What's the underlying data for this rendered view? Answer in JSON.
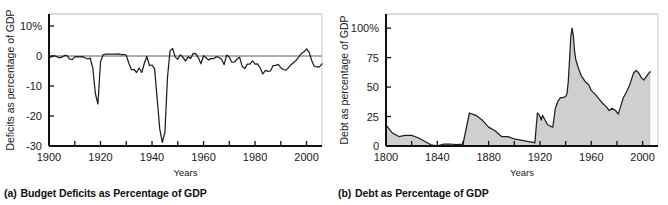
{
  "figure": {
    "background": "#ffffff",
    "line_color": "#1f1f1f",
    "fill_color": "#cfcfcf",
    "frame_color": "#111111"
  },
  "panels": [
    {
      "id": "a",
      "caption_label": "(a)",
      "caption_text": "Budget Deficits as Percentage of GDP",
      "ylabel": "Deficits as percentage of GDP",
      "xlabel": "Years"
    },
    {
      "id": "b",
      "caption_label": "(b)",
      "caption_text": "Debt as Percentage of GDP",
      "ylabel": "Debt as percentage of GDP",
      "xlabel": "Years"
    }
  ],
  "chart_data": [
    {
      "type": "line",
      "title": "Budget Deficits as Percentage of GDP",
      "xlabel": "Years",
      "ylabel": "Deficits as percentage of GDP",
      "xlim": [
        1900,
        2006
      ],
      "ylim": [
        -30,
        14
      ],
      "yticks": [
        10,
        0,
        -10,
        -20,
        -30
      ],
      "ytick_labels": [
        "10%",
        "0",
        "-10",
        "-20",
        "-30"
      ],
      "xticks": [
        1900,
        1910,
        1920,
        1930,
        1940,
        1950,
        1960,
        1970,
        1980,
        1990,
        2000
      ],
      "xtick_labels": [
        "1900",
        "",
        "1920",
        "",
        "1940",
        "",
        "1960",
        "",
        "1980",
        "",
        "2000"
      ],
      "zero_line": 0,
      "grid": false,
      "legend": false,
      "x": [
        1900,
        1901,
        1902,
        1903,
        1904,
        1905,
        1906,
        1907,
        1908,
        1909,
        1910,
        1911,
        1912,
        1913,
        1914,
        1915,
        1916,
        1917,
        1918,
        1919,
        1920,
        1921,
        1922,
        1923,
        1924,
        1925,
        1926,
        1927,
        1928,
        1929,
        1930,
        1931,
        1932,
        1933,
        1934,
        1935,
        1936,
        1937,
        1938,
        1939,
        1940,
        1941,
        1942,
        1943,
        1944,
        1945,
        1946,
        1947,
        1948,
        1949,
        1950,
        1951,
        1952,
        1953,
        1954,
        1955,
        1956,
        1957,
        1958,
        1959,
        1960,
        1961,
        1962,
        1963,
        1964,
        1965,
        1966,
        1967,
        1968,
        1969,
        1970,
        1971,
        1972,
        1973,
        1974,
        1975,
        1976,
        1977,
        1978,
        1979,
        1980,
        1981,
        1982,
        1983,
        1984,
        1985,
        1986,
        1987,
        1988,
        1989,
        1990,
        1991,
        1992,
        1993,
        1994,
        1995,
        1996,
        1997,
        1998,
        1999,
        2000,
        2001,
        2002,
        2003,
        2004,
        2005,
        2006
      ],
      "y": [
        -0.4,
        -0.3,
        0.1,
        -0.2,
        -0.6,
        -0.4,
        0.2,
        0.1,
        -1.0,
        -1.2,
        -0.3,
        -0.2,
        -0.3,
        -0.2,
        -0.6,
        -1.0,
        -0.7,
        -4.0,
        -12.5,
        -16.0,
        -2.0,
        0.4,
        0.6,
        0.6,
        0.6,
        0.6,
        0.6,
        0.7,
        0.5,
        0.5,
        0.3,
        -2.4,
        -4.6,
        -4.5,
        -5.5,
        -4.0,
        -5.5,
        -2.5,
        -0.1,
        -3.2,
        -3.0,
        -4.3,
        -14.2,
        -24.3,
        -28.8,
        -25.5,
        -7.2,
        1.7,
        2.5,
        -0.3,
        -1.1,
        0.4,
        -0.4,
        -1.7,
        -0.3,
        -0.8,
        0.9,
        0.8,
        -0.6,
        -2.6,
        0.1,
        -0.6,
        -1.3,
        -0.8,
        -0.9,
        -0.2,
        -0.5,
        -1.1,
        -2.9,
        0.3,
        -0.3,
        -2.1,
        -2.0,
        -1.1,
        -0.4,
        -3.4,
        -4.2,
        -2.7,
        -2.7,
        -1.6,
        -2.7,
        -2.6,
        -4.0,
        -6.0,
        -4.8,
        -5.1,
        -5.0,
        -3.2,
        -3.1,
        -2.8,
        -3.9,
        -4.5,
        -4.7,
        -3.9,
        -2.9,
        -2.2,
        -1.4,
        -0.3,
        0.8,
        1.4,
        2.4,
        1.3,
        -1.5,
        -3.5,
        -3.6,
        -3.6,
        -2.6,
        -1.9
      ]
    },
    {
      "type": "area",
      "title": "Debt as Percentage of GDP",
      "xlabel": "Years",
      "ylabel": "Debt as percentage of GDP",
      "xlim": [
        1800,
        2012
      ],
      "ylim": [
        0,
        112
      ],
      "yticks": [
        0,
        25,
        50,
        75,
        100
      ],
      "ytick_labels": [
        "0",
        "25",
        "50",
        "75",
        "100%"
      ],
      "xticks": [
        1800,
        1820,
        1840,
        1860,
        1880,
        1900,
        1920,
        1940,
        1960,
        1980,
        2000
      ],
      "xtick_labels": [
        "1800",
        "",
        "1840",
        "",
        "1880",
        "",
        "1920",
        "",
        "1960",
        "",
        "2000"
      ],
      "grid": false,
      "legend": false,
      "x": [
        1800,
        1805,
        1810,
        1815,
        1820,
        1825,
        1830,
        1835,
        1840,
        1845,
        1850,
        1855,
        1860,
        1865,
        1870,
        1875,
        1880,
        1885,
        1890,
        1895,
        1900,
        1905,
        1910,
        1915,
        1916,
        1918,
        1919,
        1920,
        1921,
        1922,
        1923,
        1924,
        1925,
        1926,
        1928,
        1930,
        1932,
        1934,
        1936,
        1938,
        1940,
        1941,
        1942,
        1943,
        1944,
        1945,
        1946,
        1947,
        1948,
        1950,
        1952,
        1955,
        1958,
        1960,
        1963,
        1966,
        1969,
        1972,
        1974,
        1976,
        1979,
        1981,
        1983,
        1985,
        1987,
        1990,
        1993,
        1995,
        1997,
        1999,
        2001,
        2003,
        2005,
        2006
      ],
      "y": [
        18,
        11,
        8,
        9,
        9,
        7,
        4,
        1,
        0.2,
        1.5,
        1.7,
        1.2,
        1.5,
        28,
        26,
        22,
        16,
        13,
        8,
        8,
        6,
        5,
        4,
        3,
        2.5,
        28,
        27,
        25,
        22,
        26,
        24,
        22,
        20,
        18,
        17,
        16,
        32,
        38,
        41,
        41,
        42,
        44,
        54,
        72,
        92,
        100,
        94,
        80,
        73,
        66,
        60,
        55,
        52,
        47,
        44,
        40,
        36,
        33,
        30,
        32,
        30,
        27,
        34,
        41,
        45,
        52,
        62,
        64,
        62,
        58,
        56,
        59,
        62,
        63
      ]
    }
  ]
}
